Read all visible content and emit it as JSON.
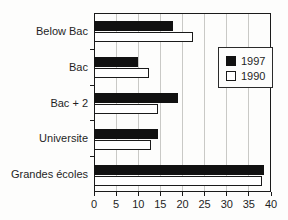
{
  "chart_data": {
    "type": "bar",
    "orientation": "horizontal",
    "title": "",
    "xlabel": "",
    "ylabel": "",
    "categories": [
      "Below Bac",
      "Bac",
      "Bac + 2",
      "Universite",
      "Grandes écoles"
    ],
    "series": [
      {
        "name": "1997",
        "color": "#111111",
        "values": [
          18,
          10,
          19,
          14.5,
          38.5
        ]
      },
      {
        "name": "1990",
        "color": "#ffffff",
        "values": [
          22.5,
          12.5,
          14.5,
          13,
          38
        ]
      }
    ],
    "xlim": [
      0,
      40
    ],
    "xticks": [
      0,
      5,
      10,
      15,
      20,
      25,
      30,
      35,
      40
    ],
    "grid": true,
    "gridline_color": "#c9c9c6",
    "legend_position": "upper-right",
    "legend_entries": [
      "1997",
      "1990"
    ]
  }
}
